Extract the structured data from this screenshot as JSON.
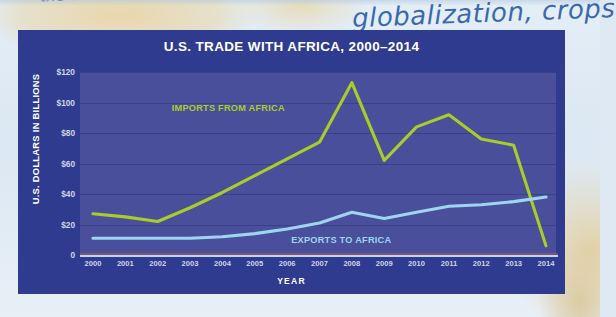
{
  "page": {
    "handwriting_note": "globalization, crops",
    "handwriting_faint_top": "the world"
  },
  "chart_data": {
    "type": "line",
    "title": "U.S. TRADE WITH AFRICA, 2000–2014",
    "xlabel": "YEAR",
    "ylabel": "U.S. DOLLARS IN BILLIONS",
    "categories": [
      "2000",
      "2001",
      "2002",
      "2003",
      "2004",
      "2005",
      "2006",
      "2007",
      "2008",
      "2009",
      "2010",
      "2011",
      "2012",
      "2013",
      "2014"
    ],
    "ylim": [
      0,
      120
    ],
    "yticks": [
      0,
      20,
      40,
      60,
      80,
      100,
      120
    ],
    "ytick_labels": [
      "0",
      "$20",
      "$40",
      "$60",
      "$80",
      "$100",
      "$120"
    ],
    "grid": true,
    "legend_position": "inline-annotation",
    "series": [
      {
        "name": "IMPORTS FROM AFRICA",
        "color": "#a8cc29",
        "values": [
          27,
          25,
          22,
          31,
          41,
          52,
          63,
          74,
          113,
          62,
          84,
          92,
          76,
          72,
          6
        ]
      },
      {
        "name": "EXPORTS TO AFRICA",
        "color": "#9fd4f0",
        "values": [
          11,
          11,
          11,
          11,
          12,
          14,
          17,
          21,
          28,
          24,
          28,
          32,
          33,
          35,
          38
        ]
      }
    ],
    "annotations": [
      {
        "text": "IMPORTS FROM AFRICA",
        "color": "#a8cc29"
      },
      {
        "text": "EXPORTS TO AFRICA",
        "color": "#9fd4f0"
      }
    ]
  }
}
